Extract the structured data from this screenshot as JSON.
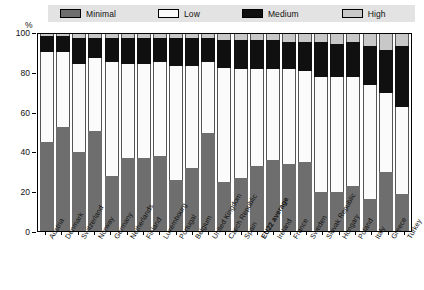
{
  "chart_data": {
    "type": "bar",
    "subtype": "stacked-bar-100",
    "title": "",
    "xlabel": "",
    "ylabel": "%",
    "ylim": [
      0,
      100
    ],
    "yticks": [
      0,
      20,
      40,
      60,
      80,
      100
    ],
    "grid": false,
    "legend_position": "top",
    "legend": [
      "Minimal",
      "Low",
      "Medium",
      "High"
    ],
    "colors": {
      "Minimal": "#6e6e6e",
      "Low": "#fbfbfb",
      "Medium": "#101010",
      "High": "#c8c8c8"
    },
    "categories": [
      "Austria",
      "Denmark",
      "Switzerland",
      "Norway",
      "Germany",
      "Netherlands",
      "Finland",
      "Luxembourg",
      "Portugal",
      "Belgium",
      "United Kingdom",
      "Czech Republic",
      "Spain",
      "EU22 average",
      "Ireland",
      "France",
      "Sweden",
      "Slovak Republic",
      "Hungary",
      "Poland",
      "Italy",
      "Greece",
      "Turkey"
    ],
    "highlight_category": "EU22 average",
    "series": [
      {
        "name": "Minimal",
        "values": [
          45,
          53,
          40,
          51,
          28,
          37,
          37,
          38,
          26,
          32,
          50,
          25,
          27,
          33,
          36,
          34,
          35,
          20,
          20,
          23,
          16,
          30,
          19
        ]
      },
      {
        "name": "Low",
        "values": [
          46,
          38,
          45,
          37,
          58,
          48,
          48,
          48,
          58,
          52,
          36,
          58,
          55,
          49,
          46,
          48,
          46,
          58,
          58,
          55,
          58,
          40,
          44
        ]
      },
      {
        "name": "Medium",
        "values": [
          8,
          8,
          13,
          10,
          12,
          13,
          13,
          12,
          14,
          14,
          12,
          14,
          15,
          15,
          15,
          14,
          15,
          18,
          17,
          18,
          20,
          22,
          31
        ]
      },
      {
        "name": "High",
        "values": [
          1,
          1,
          2,
          2,
          2,
          2,
          2,
          2,
          2,
          2,
          2,
          3,
          3,
          3,
          3,
          4,
          4,
          4,
          5,
          4,
          6,
          8,
          6
        ]
      }
    ]
  }
}
